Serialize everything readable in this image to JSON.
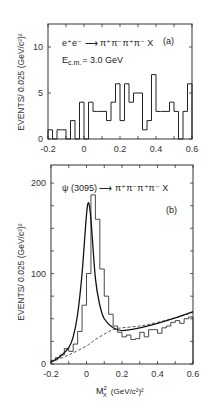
{
  "chart_data": [
    {
      "type": "bar",
      "panel": "(a)",
      "title": "e+e- → π+π-π+π- X",
      "annotation": "E_c.m. = 3.0 GeV",
      "xlabel": "",
      "ylabel": "EVENTS/ 0.025 (GeV/c²)²",
      "xlim": [
        -0.2,
        0.6
      ],
      "ylim": [
        0,
        12.5
      ],
      "x_ticks": [
        -0.2,
        0,
        0.2,
        0.4,
        0.6
      ],
      "x_tick_labels": [
        "-0.2",
        "0",
        "0.2",
        "0.4",
        "0.6"
      ],
      "y_ticks": [
        0,
        5,
        10
      ],
      "y_tick_labels": [
        "0",
        "5",
        "10"
      ],
      "bin_width": 0.025,
      "bin_start": -0.2,
      "values": [
        1,
        0,
        1,
        1,
        0,
        2,
        0,
        4,
        0,
        4,
        3,
        3,
        3,
        2,
        4,
        6,
        2,
        6,
        4,
        5,
        5,
        1,
        2,
        7,
        3,
        3,
        3,
        4,
        3,
        0,
        3,
        6
      ],
      "grid": false
    },
    {
      "type": "bar",
      "panel": "(b)",
      "title": "ψ(3095) → π+π-π+π- X",
      "xlabel": "M²_X (GeV/c²)²",
      "ylabel": "EVENTS/ 0.025 (GeV/c²)²",
      "xlim": [
        -0.2,
        0.6
      ],
      "ylim": [
        0,
        220
      ],
      "x_ticks": [
        -0.2,
        0,
        0.2,
        0.4,
        0.6
      ],
      "x_tick_labels": [
        "-0.2",
        "0",
        "0.2",
        "0.4",
        "0.6"
      ],
      "y_ticks": [
        0,
        100,
        200
      ],
      "y_tick_labels": [
        "0",
        "100",
        "200"
      ],
      "bin_width": 0.025,
      "bin_start": -0.2,
      "values": [
        4,
        7,
        10,
        17,
        14,
        22,
        36,
        65,
        100,
        187,
        160,
        105,
        75,
        55,
        42,
        35,
        30,
        32,
        27,
        28,
        35,
        30,
        38,
        38,
        34,
        40,
        42,
        46,
        48,
        45,
        50,
        52
      ],
      "fit_curve": {
        "style": "solid",
        "x": [
          -0.2,
          -0.15,
          -0.1,
          -0.075,
          -0.05,
          -0.025,
          0,
          0.0125,
          0.025,
          0.05,
          0.075,
          0.1,
          0.15,
          0.2,
          0.3,
          0.4,
          0.5,
          0.6
        ],
        "y": [
          2,
          8,
          18,
          30,
          55,
          100,
          165,
          178,
          160,
          95,
          65,
          50,
          40,
          37,
          40,
          45,
          51,
          58
        ]
      },
      "background_curve": {
        "style": "dashed",
        "x": [
          -0.2,
          -0.1,
          0,
          0.05,
          0.1,
          0.15,
          0.2,
          0.3,
          0.4,
          0.5,
          0.6
        ],
        "y": [
          2,
          10,
          20,
          27,
          33,
          38,
          40,
          42,
          46,
          51,
          57
        ]
      },
      "grid": false
    }
  ],
  "labels": {
    "a_reaction": "e⁺e⁻ ⟶ π⁺π⁻π⁺π⁻ X",
    "a_energy": "E",
    "a_energy_sub": "c.m.",
    "a_energy_val": "= 3.0 GeV",
    "a_panel": "(a)",
    "b_reaction": "ψ (3095) ⟶ π⁺π⁻π⁺π⁻ X",
    "b_panel": "(b)",
    "ylabel_a": "EVENTS/ 0.025 (GeV/c²)²",
    "ylabel_b": "EVENTS/ 0.025 (GeV/c²)²",
    "xlabel_b_main": "M",
    "xlabel_b_sup": "2",
    "xlabel_b_sub": "X",
    "xlabel_b_units": "(GeV/c²)²"
  }
}
